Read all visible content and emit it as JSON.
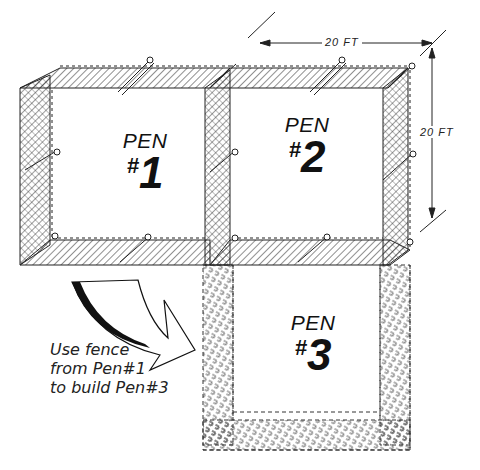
{
  "diagram": {
    "pens": [
      {
        "word": "PEN",
        "hash": "#",
        "number": "1",
        "style": "solid"
      },
      {
        "word": "PEN",
        "hash": "#",
        "number": "2",
        "style": "solid"
      },
      {
        "word": "PEN",
        "hash": "#",
        "number": "3",
        "style": "dashed"
      }
    ],
    "dimensions": {
      "width": "20 FT",
      "depth": "20 FT"
    },
    "note": {
      "line1": "Use fence",
      "line2": "from Pen#1",
      "line3": "to build Pen#3"
    },
    "colors": {
      "ink": "#111111",
      "background": "#ffffff"
    }
  }
}
